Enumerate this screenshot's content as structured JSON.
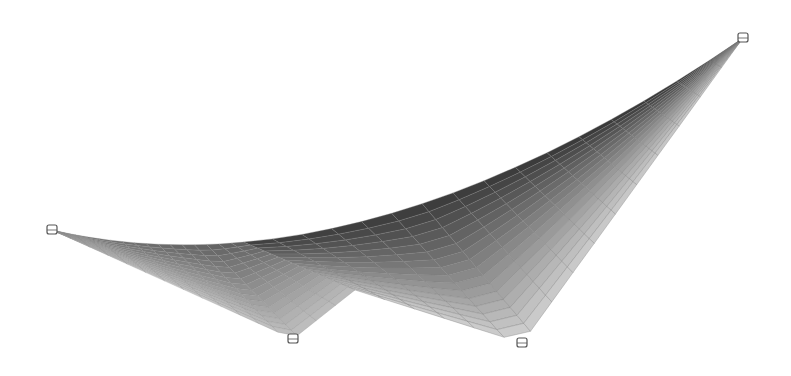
{
  "figure": {
    "type": "3d-tensile-membrane-surface",
    "background": "#ffffff",
    "colors": {
      "dark_edge": "#3a3a3a",
      "mid": "#8a8a8a",
      "light": "#d4d4d4",
      "lightest": "#e6e6e6",
      "grid_line": "#7a7a7a",
      "anchor_stroke": "#555555"
    },
    "anchors": [
      {
        "id": "left",
        "x": 52,
        "y": 230
      },
      {
        "id": "top-right",
        "x": 743,
        "y": 38
      },
      {
        "id": "bottom-middle",
        "x": 293,
        "y": 339
      },
      {
        "id": "bottom-right",
        "x": 522,
        "y": 343
      }
    ],
    "edges": [
      {
        "from": "left",
        "to": "top-right",
        "shape": "catenary-sag",
        "control": [
          360,
          300
        ]
      },
      {
        "from": "left",
        "to": "bottom-middle",
        "shape": "straight"
      },
      {
        "from": "bottom-middle",
        "to": "bottom-right",
        "shape": "fold",
        "via": [
          355,
          290
        ]
      },
      {
        "from": "bottom-right",
        "to": "top-right",
        "shape": "straight"
      }
    ],
    "mesh": {
      "u_divisions": 16,
      "v_divisions": 16
    }
  }
}
